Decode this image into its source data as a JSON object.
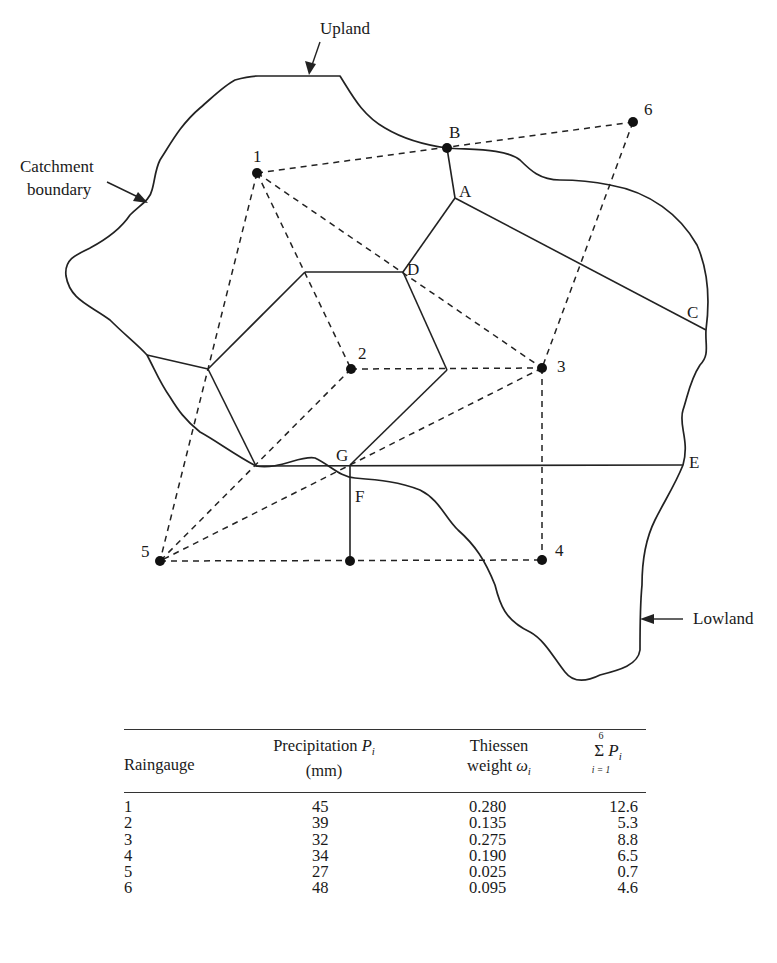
{
  "diagram": {
    "callouts": {
      "upland": "Upland",
      "catchment_line1": "Catchment",
      "catchment_line2": "boundary",
      "lowland": "Lowland"
    },
    "gauges": [
      {
        "id": "1",
        "label": "1",
        "x": 257,
        "y": 173
      },
      {
        "id": "2",
        "label": "2",
        "x": 351,
        "y": 369
      },
      {
        "id": "3",
        "label": "3",
        "x": 542,
        "y": 368
      },
      {
        "id": "4",
        "label": "4",
        "x": 542,
        "y": 560
      },
      {
        "id": "5",
        "label": "5",
        "x": 160,
        "y": 561
      },
      {
        "id": "6",
        "label": "6",
        "x": 633,
        "y": 122
      }
    ],
    "vertex_labels": {
      "A": "A",
      "B": "B",
      "C": "C",
      "D": "D",
      "E": "E",
      "F": "F",
      "G": "G"
    }
  },
  "table": {
    "headers": {
      "raingauge": "Raingauge",
      "precip_line1": "Precipitation ",
      "precip_symbol": "P",
      "precip_sub": "i",
      "precip_line2": "(mm)",
      "weight_line1": "Thiessen",
      "weight_line2": "weight ",
      "weight_symbol": "ω",
      "weight_sub": "i",
      "sum_top": "6",
      "sum_sigma": "Σ",
      "sum_symbol": "P",
      "sum_sub": "i",
      "sum_bottom": "i = 1"
    },
    "rows": [
      {
        "gauge": "1",
        "precipitation": "45",
        "weight": "0.280",
        "weighted": "12.6"
      },
      {
        "gauge": "2",
        "precipitation": "39",
        "weight": "0.135",
        "weighted": "5.3"
      },
      {
        "gauge": "3",
        "precipitation": "32",
        "weight": "0.275",
        "weighted": "8.8"
      },
      {
        "gauge": "4",
        "precipitation": "34",
        "weight": "0.190",
        "weighted": "6.5"
      },
      {
        "gauge": "5",
        "precipitation": "27",
        "weight": "0.025",
        "weighted": "0.7"
      },
      {
        "gauge": "6",
        "precipitation": "48",
        "weight": "0.095",
        "weighted": "4.6"
      }
    ]
  }
}
